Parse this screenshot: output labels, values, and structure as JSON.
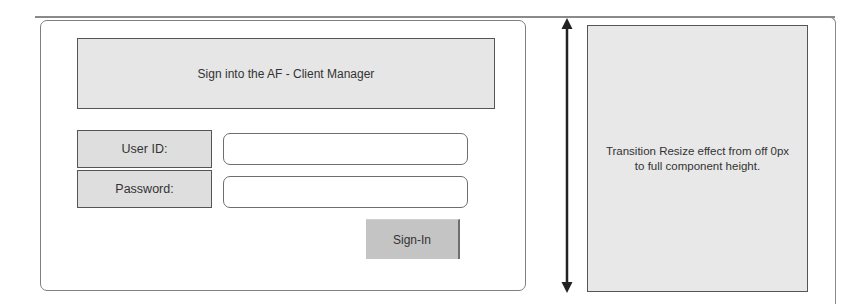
{
  "login": {
    "title": "Sign into the AF - Client Manager",
    "user_id_label": "User ID:",
    "user_id_value": "",
    "password_label": "Password:",
    "password_value": "",
    "sign_in_label": "Sign-In"
  },
  "annotation": {
    "arrow": "double-headed-vertical-arrow",
    "panel_text": "Transition Resize effect from off 0px to full component height."
  },
  "colors": {
    "panel_fill": "#e8e8e8",
    "button_fill": "#c4c4c4",
    "border": "#555555"
  }
}
